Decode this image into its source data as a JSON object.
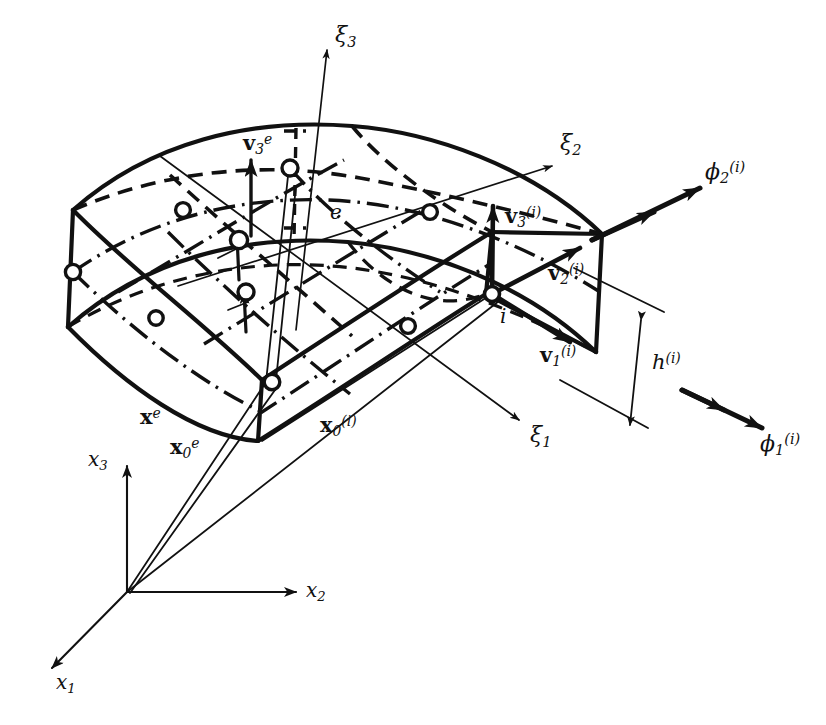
{
  "figure": {
    "type": "technical-line-diagram",
    "background_color": "#ffffff",
    "ink_color": "#111111"
  },
  "labels": {
    "xi3": {
      "base": "ξ",
      "sub": "3"
    },
    "xi2": {
      "base": "ξ",
      "sub": "2"
    },
    "xi1": {
      "base": "ξ",
      "sub": "1"
    },
    "x1": {
      "base": "x",
      "sub": "1"
    },
    "x2": {
      "base": "x",
      "sub": "2"
    },
    "x3": {
      "base": "x",
      "sub": "3"
    },
    "v3e": {
      "base": "v",
      "sub": "3",
      "sup": "e"
    },
    "v1i": {
      "base": "v",
      "sub": "1",
      "sup": "(i)"
    },
    "v2i": {
      "base": "v",
      "sub": "2",
      "sup": "(i)"
    },
    "v3i": {
      "base": "v",
      "sub": "3",
      "sup": "(i)"
    },
    "phi1i": {
      "base": "ϕ",
      "sub": "1",
      "sup": "(i)"
    },
    "phi2i": {
      "base": "ϕ",
      "sub": "2",
      "sup": "(i)"
    },
    "hi": {
      "base": "h",
      "sup": "(i)"
    },
    "xe": {
      "base": "x",
      "sup": "e"
    },
    "x0e": {
      "base": "x",
      "sub": "0",
      "sup": "e"
    },
    "x0i": {
      "base": "x",
      "sub": "0",
      "sup": "(i)"
    },
    "element_e": {
      "base": "e"
    },
    "node_i": {
      "base": "i"
    }
  },
  "geometry": {
    "global_origin": {
      "x": 127,
      "y": 592
    },
    "node_i": {
      "x": 492,
      "y": 294
    },
    "element_nodes_count": 9,
    "axes": [
      {
        "name": "x1",
        "from": [
          127,
          592
        ],
        "to": [
          48,
          672
        ]
      },
      {
        "name": "x2",
        "from": [
          127,
          592
        ],
        "to": [
          300,
          592
        ]
      },
      {
        "name": "x3",
        "from": [
          127,
          592
        ],
        "to": [
          127,
          462
        ]
      },
      {
        "name": "xi1",
        "from": [
          300,
          255
        ],
        "to": [
          523,
          423
        ]
      },
      {
        "name": "xi2",
        "from": [
          300,
          255
        ],
        "to": [
          556,
          165
        ]
      },
      {
        "name": "xi3",
        "from": [
          300,
          255
        ],
        "to": [
          327,
          46
        ]
      }
    ],
    "position_vectors": [
      {
        "name": "xe",
        "from": [
          127,
          592
        ],
        "to": [
          268,
          386
        ]
      },
      {
        "name": "x0e",
        "from": [
          127,
          592
        ],
        "to": [
          272,
          390
        ]
      },
      {
        "name": "x0i",
        "from": [
          127,
          592
        ],
        "to": [
          500,
          300
        ]
      }
    ],
    "thickness_dimension": {
      "name": "hi",
      "from": [
        643,
        317
      ],
      "to": [
        627,
        431
      ]
    }
  }
}
